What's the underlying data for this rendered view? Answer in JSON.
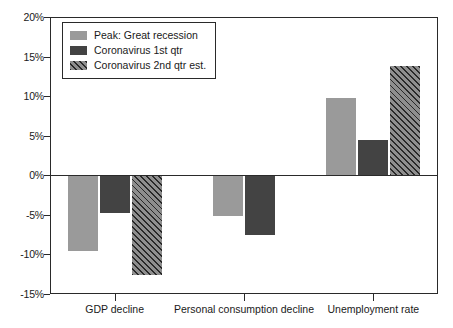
{
  "chart_data": {
    "type": "bar",
    "title": "",
    "xlabel": "",
    "ylabel": "",
    "categories": [
      "GDP decline",
      "Personal consumption decline",
      "Unemployment rate"
    ],
    "series": [
      {
        "name": "Peak: Great recession",
        "values": [
          -9.6,
          -5.2,
          9.8
        ]
      },
      {
        "name": "Coronavirus 1st qtr",
        "values": [
          -4.8,
          -7.6,
          4.4
        ]
      },
      {
        "name": "Coronavirus 2nd qtr est.",
        "values": [
          -12.6,
          null,
          13.8
        ]
      }
    ],
    "ylim": [
      -15,
      20
    ],
    "ytick_values": [
      20,
      15,
      10,
      5,
      0,
      -5,
      -10,
      -15
    ],
    "ytick_labels": [
      "20%",
      "15%",
      "10%",
      "5%",
      "0%",
      "-5%",
      "-10%",
      "-15%"
    ],
    "grid": false,
    "legend_position": "top-left",
    "colors": {
      "peak_great_recession": "#9a9a9a",
      "coronavirus_1st_qtr": "#434343",
      "coronavirus_2nd_qtr_est": "#8e8e8e",
      "axis": "#2a2a2a",
      "background": "#ffffff"
    }
  },
  "legend": {
    "items": [
      {
        "label": "Peak: Great recession"
      },
      {
        "label": "Coronavirus 1st qtr"
      },
      {
        "label": "Coronavirus 2nd qtr est."
      }
    ]
  }
}
